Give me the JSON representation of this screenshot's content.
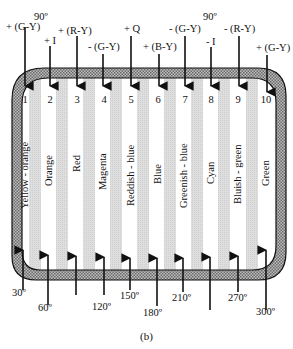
{
  "figure": {
    "caption": "(b)",
    "top_axis_label": "90º",
    "top_axis_label_right": "90º"
  },
  "bars": [
    {
      "index": "1",
      "name": "Yellow - orange",
      "x": 24,
      "top_signal": "+ (G-Y)",
      "bottom_angle": "30º"
    },
    {
      "index": "2",
      "name": "Orange",
      "x": 49,
      "top_signal": "+ I",
      "bottom_angle": "60º"
    },
    {
      "index": "3",
      "name": "Red",
      "x": 77,
      "top_signal": "+ (R-Y)",
      "bottom_angle": ""
    },
    {
      "index": "4",
      "name": "Magenta",
      "x": 104,
      "top_signal": "- (G-Y)",
      "bottom_angle": "120º"
    },
    {
      "index": "5",
      "name": "Reddish - blue",
      "x": 130,
      "top_signal": "+ Q",
      "bottom_angle": "150º"
    },
    {
      "index": "6",
      "name": "Blue",
      "x": 158,
      "top_signal": "+ (B-Y)",
      "bottom_angle": "180º"
    },
    {
      "index": "7",
      "name": "Greenish - blue",
      "x": 184,
      "top_signal": "- (G-Y)",
      "bottom_angle": "210º"
    },
    {
      "index": "8",
      "name": "Cyan",
      "x": 210,
      "top_signal": "- I",
      "bottom_angle": ""
    },
    {
      "index": "9",
      "name": "Bluish - green",
      "x": 239,
      "top_signal": "- (R-Y)",
      "bottom_angle": "270º"
    },
    {
      "index": "10",
      "name": "Green",
      "x": 266,
      "top_signal": "+ (G-Y)",
      "bottom_angle": "300º"
    }
  ],
  "colors": {
    "stripe_gray": "#d9d9d9",
    "border_hatch": "#9a9a9a",
    "ink": "#111111"
  }
}
